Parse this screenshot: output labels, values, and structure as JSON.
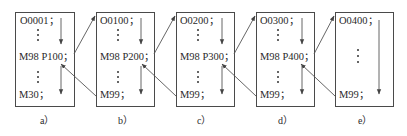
{
  "diagram": {
    "colors": {
      "stroke": "#4a4a4a",
      "text": "#2a2a2a",
      "background": "#ffffff"
    },
    "panels": [
      {
        "id": "a",
        "caption": "a）",
        "header": "O0001；",
        "call": "M98 P100；",
        "end": "M30；"
      },
      {
        "id": "b",
        "caption": "b）",
        "header": "O0100；",
        "call": "M98 P200；",
        "end": "M99；"
      },
      {
        "id": "c",
        "caption": "c）",
        "header": "O0200；",
        "call": "M98 P300；",
        "end": "M99；"
      },
      {
        "id": "d",
        "caption": "d）",
        "header": "O0300；",
        "call": "M98 P400；",
        "end": "M99；"
      },
      {
        "id": "e",
        "caption": "e）",
        "header": "O0400；",
        "call": "",
        "end": "M99；"
      }
    ],
    "connections": [
      {
        "from": "a.call",
        "to": "b.header",
        "type": "call"
      },
      {
        "from": "b.end",
        "to": "a.call",
        "type": "return"
      },
      {
        "from": "b.call",
        "to": "c.header",
        "type": "call"
      },
      {
        "from": "c.end",
        "to": "b.call",
        "type": "return"
      },
      {
        "from": "c.call",
        "to": "d.header",
        "type": "call"
      },
      {
        "from": "d.end",
        "to": "c.call",
        "type": "return"
      },
      {
        "from": "d.call",
        "to": "e.header",
        "type": "call"
      },
      {
        "from": "e.end",
        "to": "d.call",
        "type": "return"
      }
    ]
  }
}
